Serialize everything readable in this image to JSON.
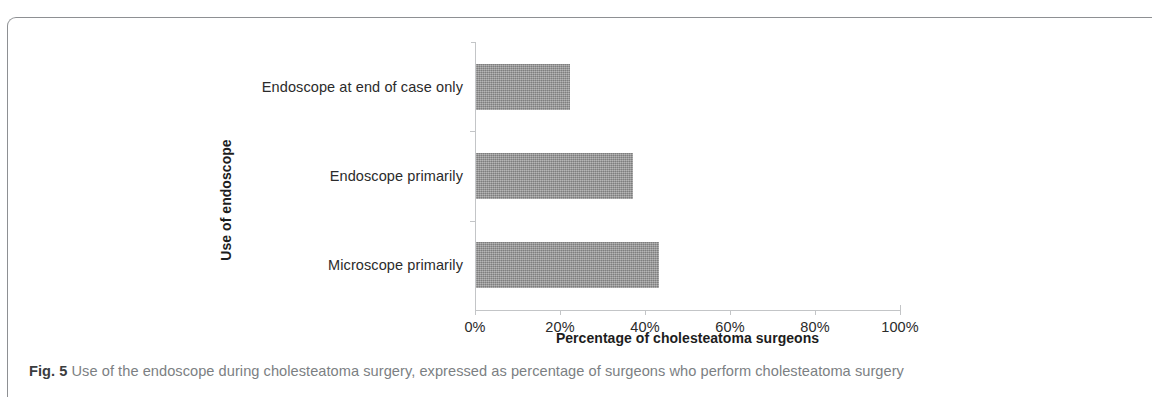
{
  "figure": {
    "caption_label": "Fig. 5",
    "caption_text": " Use of the endoscope during cholesteatoma surgery, expressed as percentage of surgeons who perform cholesteatoma surgery"
  },
  "chart_data": {
    "type": "bar",
    "orientation": "horizontal",
    "title": "",
    "xlabel": "Percentage of cholesteatoma surgeons",
    "ylabel": "Use of endoscope",
    "categories": [
      "Endoscope at end of case only",
      "Endoscope primarily",
      "Microscope primarily"
    ],
    "values": [
      22,
      37,
      43
    ],
    "xlim": [
      0,
      100
    ],
    "xticks": [
      0,
      20,
      40,
      60,
      80,
      100
    ],
    "xtick_labels": [
      "0%",
      "20%",
      "40%",
      "60%",
      "80%",
      "100%"
    ],
    "grid": false,
    "legend": false,
    "bar_color": "#9a9a9a",
    "axis_color": "#c3c5c7"
  }
}
